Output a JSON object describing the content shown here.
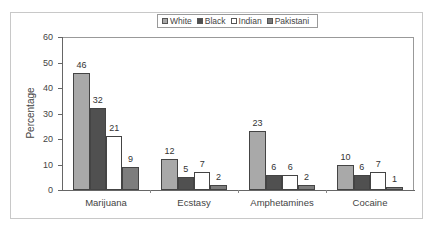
{
  "chart_data": {
    "type": "bar",
    "title": "",
    "xlabel": "",
    "ylabel": "Percentage",
    "ylim": [
      0,
      60
    ],
    "yticks": [
      0,
      10,
      20,
      30,
      40,
      50,
      60
    ],
    "grid": false,
    "legend_position": "top",
    "categories": [
      "Marijuana",
      "Ecstasy",
      "Amphetamines",
      "Cocaine"
    ],
    "series": [
      {
        "name": "White",
        "color": "#a9a9a9",
        "values": [
          46,
          12,
          23,
          10
        ]
      },
      {
        "name": "Black",
        "color": "#505050",
        "values": [
          32,
          5,
          6,
          6
        ]
      },
      {
        "name": "Indian",
        "color": "#ffffff",
        "values": [
          21,
          7,
          6,
          7
        ]
      },
      {
        "name": "Pakistani",
        "color": "#7d7d7d",
        "values": [
          9,
          2,
          2,
          1
        ]
      }
    ]
  }
}
